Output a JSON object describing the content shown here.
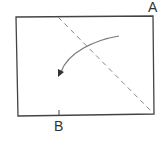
{
  "diagram": {
    "type": "folding-instruction",
    "labels": {
      "corner_a": "A",
      "point_b": "B"
    },
    "colors": {
      "outline": "#444444",
      "fold_line": "#888888",
      "arrow": "#777777",
      "label": "#333333"
    },
    "elements": {
      "sheet": "rectangle-sheet",
      "fold_line": "dashed-diagonal-fold-line",
      "arrow": "curved-fold-direction-arrow"
    }
  }
}
